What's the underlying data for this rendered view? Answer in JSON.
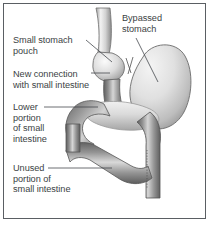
{
  "figure": {
    "background_color": "#ffffff",
    "border_color": "#5a5e63",
    "text_color": "#3b3f44",
    "organ_light_color": "#e8e8e8",
    "organ_mid_color": "#b6b6b6",
    "organ_dark_color": "#6f6f6f"
  },
  "labels": {
    "bypassed_stomach": "Bypassed\nstomach",
    "small_stomach_pouch": "Small stomach\npouch",
    "new_connection": "New connection\nwith small intestine",
    "lower_portion": "Lower\nportion\nof small\nintestine",
    "unused_portion": "Unused\nportion of\nsmall intestine"
  },
  "structures": [
    {
      "name": "esophagus",
      "description": "tube entering from top"
    },
    {
      "name": "small-stomach-pouch",
      "description": "small pouch below esophagus"
    },
    {
      "name": "bypassed-stomach",
      "description": "large remnant stomach at right"
    },
    {
      "name": "roux-limb",
      "description": "intestine attached to pouch"
    },
    {
      "name": "lower-small-intestine",
      "description": "looping intestine at center"
    },
    {
      "name": "unused-small-intestine",
      "description": "lower looping intestine"
    }
  ]
}
